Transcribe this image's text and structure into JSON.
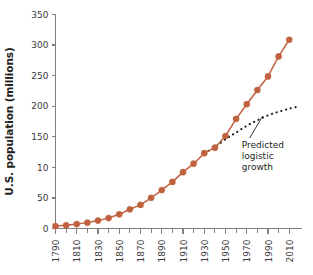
{
  "chart_data": {
    "type": "line",
    "title": "",
    "xlabel": "",
    "ylabel": "U.S. population (millions)",
    "xlim": [
      1790,
      2022
    ],
    "ylim": [
      0,
      350
    ],
    "grid": false,
    "legend_position": "none",
    "x_major_ticks": [
      1790,
      1810,
      1830,
      1850,
      1870,
      1890,
      1910,
      1930,
      1950,
      1970,
      1990,
      2010
    ],
    "x_major_tick_labels": [
      "1790",
      "1810",
      "1830",
      "1850",
      "1870",
      "1890",
      "1910",
      "1930",
      "1950",
      "1970",
      "1990",
      "2010"
    ],
    "x_minor_ticks": [
      1800,
      1820,
      1840,
      1860,
      1880,
      1900,
      1920,
      1940,
      1960,
      1980,
      2000
    ],
    "y_ticks": [
      0,
      50,
      100,
      150,
      200,
      250,
      300,
      350
    ],
    "y_tick_labels": [
      "0",
      "50",
      "10",
      "150",
      "200",
      "250",
      "300",
      "350"
    ],
    "series": [
      {
        "name": "U.S. population",
        "style": "line-with-markers",
        "color": "#c0623f",
        "x": [
          1790,
          1800,
          1810,
          1820,
          1830,
          1840,
          1850,
          1860,
          1870,
          1880,
          1890,
          1900,
          1910,
          1920,
          1930,
          1940,
          1950,
          1960,
          1970,
          1980,
          1990,
          2000,
          2010
        ],
        "values": [
          3.9,
          5.3,
          7.2,
          9.6,
          12.9,
          17.1,
          23.2,
          31.4,
          38.6,
          50.2,
          62.9,
          76.2,
          92.2,
          106.0,
          123.2,
          132.2,
          151.3,
          179.3,
          203.3,
          226.5,
          248.7,
          281.4,
          308.7
        ]
      },
      {
        "name": "Predicted logistic growth",
        "style": "dotted",
        "color": "#1a1a1a",
        "x": [
          1930,
          1940,
          1950,
          1960,
          1970,
          1980,
          1990,
          2000,
          2010,
          2020
        ],
        "values": [
          123.2,
          133.0,
          146.0,
          157.0,
          168.0,
          177.0,
          185.0,
          191.0,
          196.0,
          200.0
        ]
      }
    ],
    "annotations": [
      {
        "name": "predicted-logistic-growth-label",
        "lines": [
          "Predicted",
          "logistic",
          "growth"
        ],
        "points_to_x": 1985,
        "points_to_y": 184
      }
    ]
  }
}
